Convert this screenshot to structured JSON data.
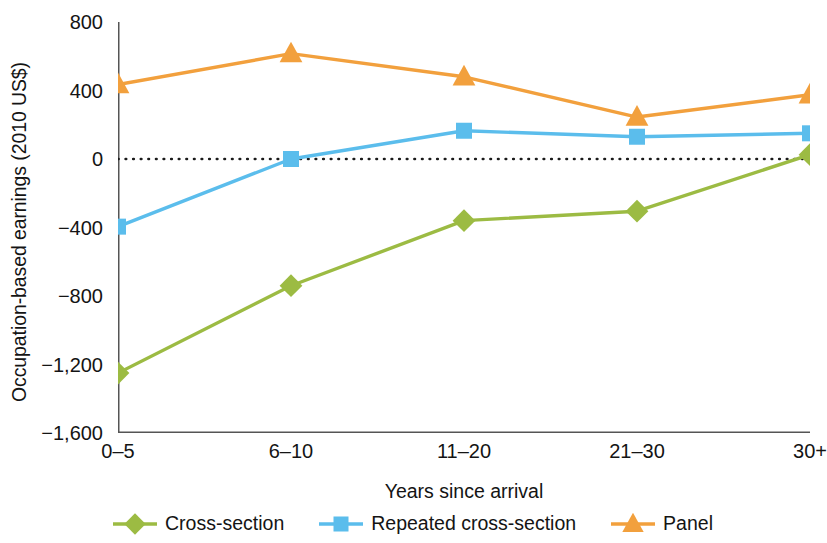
{
  "chart_data": {
    "type": "line",
    "title": "",
    "xlabel": "Years since arrival",
    "ylabel": "Occupation-based earnings (2010 US$)",
    "categories": [
      "0–5",
      "6–10",
      "11–20",
      "21–30",
      "30+"
    ],
    "ylim": [
      -1600,
      800
    ],
    "yticks": [
      800,
      400,
      0,
      -400,
      -800,
      -1200,
      -1600
    ],
    "ytick_labels": [
      "800",
      "400",
      "0",
      "−400",
      "−800",
      "−1,200",
      "−1,600"
    ],
    "grid": false,
    "zero_line": true,
    "legend_position": "bottom",
    "series": [
      {
        "name": "Cross-section",
        "color": "#9CBB43",
        "marker": "diamond",
        "values": [
          -1250,
          -740,
          -360,
          -305,
          25
        ]
      },
      {
        "name": "Repeated cross-section",
        "color": "#5BBDEC",
        "marker": "square",
        "values": [
          -395,
          0,
          165,
          130,
          150
        ]
      },
      {
        "name": "Panel",
        "color": "#F2A03D",
        "marker": "triangle",
        "values": [
          435,
          615,
          480,
          245,
          375
        ]
      }
    ]
  },
  "axis": {
    "line_color": "#555555",
    "zero_line_color": "#1a1a1a"
  }
}
